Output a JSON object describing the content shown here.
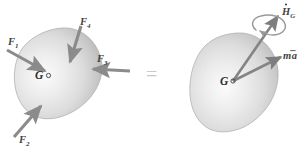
{
  "figure": {
    "equals_symbol": "=",
    "colors": {
      "body_fill_light": "#f2f2f2",
      "body_fill_mid": "#d8d8d8",
      "body_fill_dark": "#b9b9b9",
      "body_outline": "#a8a8a8",
      "arrow": "#8f8f8f",
      "arrow_dark": "#7a7a7a",
      "label_text": "#3f3f3f",
      "equals": "#c9c9c9",
      "background": "#ffffff"
    }
  },
  "left_diagram": {
    "name": "applied-forces-body",
    "center_label": {
      "symbol": "G",
      "marker": "open-circle"
    },
    "forces": [
      {
        "id": "F1",
        "symbol": "F",
        "subscript": "1",
        "direction": "down-right",
        "label_x": 10,
        "label_y": 43
      },
      {
        "id": "F4",
        "symbol": "F",
        "subscript": "4",
        "direction": "down-left",
        "label_x": 79,
        "label_y": 32
      },
      {
        "id": "F3",
        "symbol": "F",
        "subscript": "3",
        "direction": "left",
        "label_x": 98,
        "label_y": 63
      },
      {
        "id": "F2",
        "symbol": "F",
        "subscript": "2",
        "direction": "up-right",
        "label_x": 21,
        "label_y": 142
      }
    ]
  },
  "right_diagram": {
    "name": "kinetic-vectors-body",
    "center_label": {
      "symbol": "G",
      "marker": "open-circle"
    },
    "vectors": [
      {
        "id": "Hdot_G",
        "symbol": "H",
        "accent": "dot",
        "subscript": "G",
        "direction": "up-right",
        "has_rotation_arc": true,
        "label_x": 281,
        "label_y": 14
      },
      {
        "id": "m_abar",
        "symbol": "m",
        "vector_symbol": "a",
        "accent": "overbar",
        "direction": "up-right",
        "has_rotation_arc": false,
        "label_x": 283,
        "label_y": 57
      }
    ]
  }
}
